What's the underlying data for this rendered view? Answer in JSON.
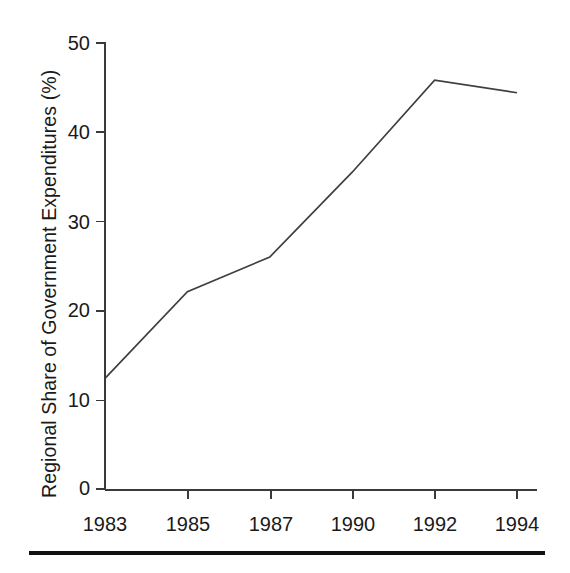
{
  "chart_data": {
    "type": "line",
    "title": "",
    "subtitle": "",
    "xlabel": "",
    "ylabel": "Regional Share of Government Expenditures (%)",
    "categories": [
      "1983",
      "1985",
      "1987",
      "1990",
      "1992",
      "1994"
    ],
    "x": [
      1983,
      1985,
      1987,
      1990,
      1992,
      1994
    ],
    "values": [
      12.4,
      22.1,
      26.0,
      35.5,
      45.8,
      44.4
    ],
    "series": [
      {
        "name": "Regional Share of Government Expenditures",
        "values": [
          12.4,
          22.1,
          26.0,
          35.5,
          45.8,
          44.4
        ]
      }
    ],
    "ylim": [
      0,
      50
    ],
    "ytick_labels": [
      "0",
      "10",
      "20",
      "30",
      "40",
      "50"
    ],
    "ytick_values": [
      0,
      10,
      20,
      30,
      40,
      50
    ],
    "xtick_labels": [
      "1983",
      "1985",
      "1987",
      "1990",
      "1992",
      "1994"
    ],
    "grid": false,
    "legend": false,
    "legend_position": "none",
    "markers": false,
    "annotations": [],
    "line_color": "#3f3f3f",
    "axis_color": "#3a3a3a",
    "background_color": "#ffffff",
    "note": "Data point at 1990 lies on the straight segment between 1987 and 1992"
  },
  "figure": {
    "footer_rule_color": "#111111"
  }
}
